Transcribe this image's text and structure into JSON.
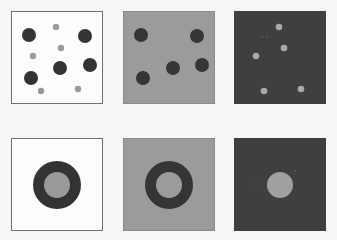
{
  "colors": {
    "white_bg": "#fdfdfd",
    "gray_bg": "#9a9a9a",
    "dark_bg": "#3e3e3e",
    "dark_dot": "#333333",
    "gray_dot": "#9a9a9a",
    "light_dot": "#a8a8a8",
    "border": "#6f6f6f"
  },
  "panels": [
    {
      "id": "top-left",
      "row": 0,
      "col": 0,
      "background": "white",
      "content": "large dark dots and small gray dots"
    },
    {
      "id": "top-middle",
      "row": 0,
      "col": 1,
      "background": "gray",
      "content": "large dark dots only"
    },
    {
      "id": "top-right",
      "row": 0,
      "col": 2,
      "background": "dark",
      "content": "small gray dots only"
    },
    {
      "id": "bottom-left",
      "row": 1,
      "col": 0,
      "background": "white",
      "content": "dark ring with gray center"
    },
    {
      "id": "bottom-middle",
      "row": 1,
      "col": 1,
      "background": "gray",
      "content": "dark ring only"
    },
    {
      "id": "bottom-right",
      "row": 1,
      "col": 2,
      "background": "dark",
      "content": "gray center disk only"
    }
  ]
}
